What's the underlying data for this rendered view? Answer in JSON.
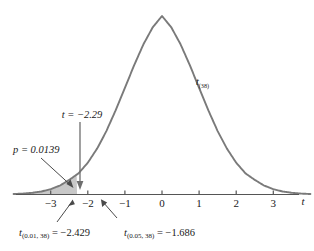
{
  "figure": {
    "title": "",
    "curve_label": "t",
    "curve_label_sub": "(38)",
    "axis_label": "t"
  },
  "annotations": {
    "test_stat": "t = −2.29",
    "p_value": "p = 0.0139",
    "crit01_main": "t",
    "crit01_sub": "(0.01, 38)",
    "crit01_value": " = −2.429",
    "crit05_main": "t",
    "crit05_sub": "(0.05, 38)",
    "crit05_value": " = −1.686"
  },
  "axis": {
    "ticks": [
      "−3",
      "−2",
      "−1",
      "0",
      "1",
      "2",
      "3"
    ],
    "tick_values": [
      -3,
      -2,
      -1,
      0,
      1,
      2,
      3
    ],
    "xmin": -4.0,
    "xmax": 4.0
  },
  "colors": {
    "curve": "#7a7a7a",
    "shade_fill": "#c8c8c8",
    "shade_stroke": "#8a8a8a",
    "axis": "#555555",
    "text": "#1a1a1a",
    "background": "#ffffff"
  },
  "chart_data": {
    "type": "line",
    "title": "",
    "subtitle": "",
    "xlabel": "t",
    "ylabel": "",
    "xlim": [
      -4.0,
      4.0
    ],
    "ylim": [
      0,
      0.4
    ],
    "grid": false,
    "legend": "none",
    "distribution": "Student t",
    "degrees_of_freedom": 38,
    "series": [
      {
        "name": "t(38) density",
        "x": [
          -4.0,
          -3.75,
          -3.5,
          -3.25,
          -3.0,
          -2.75,
          -2.5,
          -2.429,
          -2.29,
          -2.25,
          -2.0,
          -1.75,
          -1.686,
          -1.5,
          -1.25,
          -1.0,
          -0.75,
          -0.5,
          -0.25,
          0.0,
          0.25,
          0.5,
          0.75,
          1.0,
          1.25,
          1.5,
          1.75,
          2.0,
          2.25,
          2.5,
          2.75,
          3.0,
          3.25,
          3.5,
          3.75,
          4.0
        ],
        "y": [
          0.0008,
          0.0015,
          0.0028,
          0.0051,
          0.0089,
          0.0151,
          0.0246,
          0.0277,
          0.0338,
          0.0355,
          0.0534,
          0.0771,
          0.0843,
          0.1065,
          0.1413,
          0.1791,
          0.2173,
          0.2524,
          0.2809,
          0.2999,
          0.2809,
          0.2524,
          0.2173,
          0.1791,
          0.1413,
          0.1065,
          0.0771,
          0.0534,
          0.0355,
          0.0246,
          0.0151,
          0.0089,
          0.0051,
          0.0028,
          0.0015,
          0.0008
        ]
      }
    ],
    "shaded_region": {
      "label": "p = 0.0139",
      "from": -4.0,
      "to": -2.29,
      "area": 0.0139
    },
    "markers": [
      {
        "name": "test statistic",
        "x": -2.29,
        "label": "t = −2.29"
      },
      {
        "name": "critical value alpha 0.01",
        "x": -2.429,
        "label": "t(0.01, 38) = −2.429"
      },
      {
        "name": "critical value alpha 0.05",
        "x": -1.686,
        "label": "t(0.05, 38) = −1.686"
      }
    ]
  }
}
